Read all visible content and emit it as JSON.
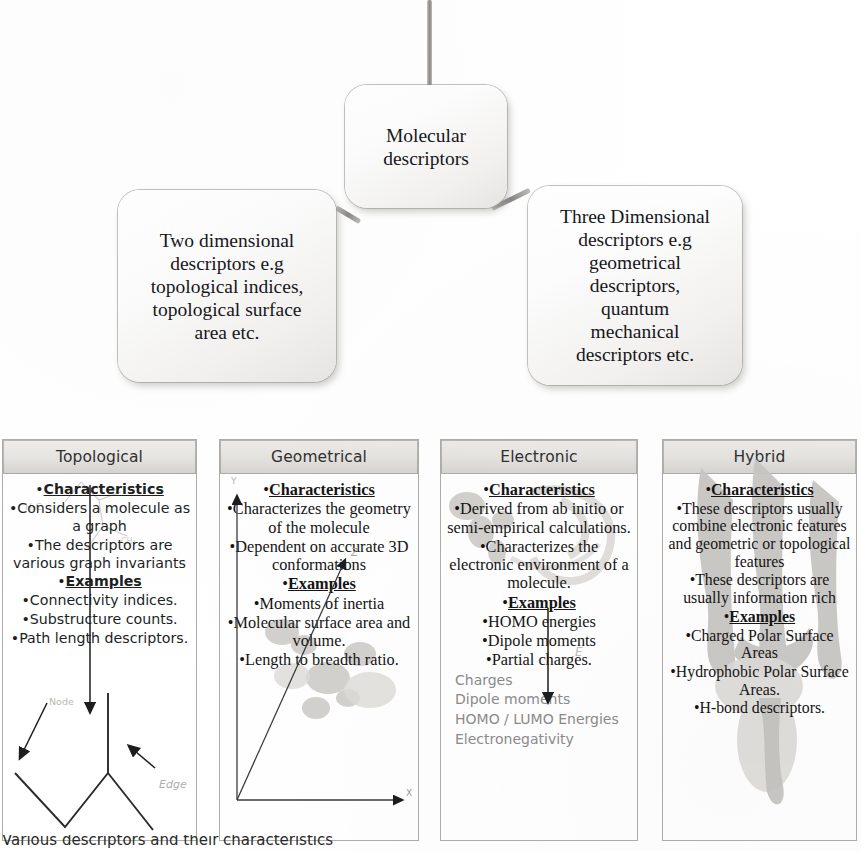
{
  "diagram": {
    "type": "hierarchy-flowchart",
    "root": {
      "label": "Molecular\ndescriptors"
    },
    "children": [
      {
        "label": "Two dimensional\ndescriptors e.g\ntopological indices,\ntopological surface\narea etc."
      },
      {
        "label": "Three Dimensional\ndescriptors e.g\ngeometrical\ndescriptors,\nquantum\nmechanical\ndescriptors etc."
      }
    ]
  },
  "columns": [
    {
      "title": "Topological",
      "sections": [
        {
          "heading": "Characteristics",
          "items": [
            "Considers a molecule as a graph",
            "The descriptors are various graph invariants"
          ]
        },
        {
          "heading": "Examples",
          "items": [
            "Connectivity indices.",
            "Substructure counts.",
            "Path length descriptors."
          ]
        }
      ],
      "sketch_labels": [
        "Node",
        "Edge",
        "H3C"
      ]
    },
    {
      "title": "Geometrical",
      "sections": [
        {
          "heading": "Characteristics",
          "items": [
            "Characterizes the geometry of the molecule",
            "Dependent on accurate 3D conformations"
          ]
        },
        {
          "heading": "Examples",
          "items": [
            "Moments of inertia",
            "Molecular surface area and volume.",
            "Length to breadth ratio."
          ]
        }
      ],
      "sketch_labels": [
        "Y",
        "Z",
        "X"
      ]
    },
    {
      "title": "Electronic",
      "sections": [
        {
          "heading": "Characteristics",
          "items": [
            "Derived from ab initio or semi-empirical calculations.",
            "Characterizes the electronic environment of a molecule."
          ]
        },
        {
          "heading": "Examples",
          "items": [
            "HOMO energies",
            "Dipole moments",
            "Partial charges."
          ]
        }
      ],
      "ghost_items": [
        "Charges",
        "Dipole moments",
        "HOMO / LUMO Energies",
        "Electronegativity"
      ],
      "sketch_labels": [
        "E"
      ]
    },
    {
      "title": "Hybrid",
      "sections": [
        {
          "heading": "Characteristics",
          "items": [
            "These descriptors usually combine electronic features and geometric or topological features",
            "These descriptors are usually information rich"
          ]
        },
        {
          "heading": "Examples",
          "items": [
            "Charged Polar Surface Areas",
            "Hydrophobic Polar Surface Areas.",
            "H-bond descriptors."
          ]
        }
      ],
      "sketch_labels": []
    }
  ],
  "caption": {
    "text": "Various descriptors and their characteristics"
  },
  "colors": {
    "box_fill": "#f4f3f1",
    "box_border": "#969490",
    "header_fill": "#e4e2df",
    "text": "#17161a",
    "ghost_text": "#8b8b8b"
  }
}
